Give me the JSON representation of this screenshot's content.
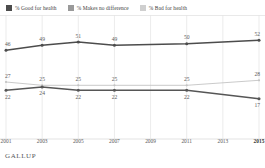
{
  "legend": {
    "items": [
      {
        "label": "% Good for health",
        "color": "#4c4c4c"
      },
      {
        "label": "% Makes no difference",
        "color": "#9a9a9a"
      },
      {
        "label": "% Bad for health",
        "color": "#cfcfcf"
      }
    ]
  },
  "footer": {
    "brand": "GALLUP"
  },
  "chart_data": {
    "type": "line",
    "title": "",
    "xlabel": "",
    "ylabel": "",
    "grid": true,
    "legend_position": "top",
    "categories": [
      "2001",
      "2003",
      "2005",
      "2007",
      "2009",
      "2011",
      "2013",
      "2015"
    ],
    "xticks": [
      "2001",
      "2003",
      "2005",
      "2007",
      "2009",
      "2011",
      "2013",
      "2015"
    ],
    "xtick_emphasis": "2015",
    "ylim": [
      0,
      60
    ],
    "series": [
      {
        "name": "% Good for health",
        "color": "#4c4c4c",
        "x": [
          "2001",
          "2003",
          "2005",
          "2007",
          "2011",
          "2015"
        ],
        "values": [
          46,
          49,
          51,
          49,
          50,
          52
        ],
        "labels": [
          "46",
          "49",
          "51",
          "49",
          "50",
          "52"
        ],
        "label_position": "above"
      },
      {
        "name": "% Makes no difference",
        "color": "#c4c4c4",
        "x": [
          "2001",
          "2003",
          "2005",
          "2007",
          "2011",
          "2015"
        ],
        "values": [
          27,
          25,
          25,
          25,
          25,
          28
        ],
        "labels": [
          "27",
          "25",
          "25",
          "25",
          "25",
          "28"
        ],
        "label_position": "above"
      },
      {
        "name": "% Bad for health",
        "color": "#565656",
        "x": [
          "2001",
          "2003",
          "2005",
          "2007",
          "2011",
          "2015"
        ],
        "values": [
          22,
          24,
          22,
          22,
          22,
          17
        ],
        "labels": [
          "22",
          "24",
          "22",
          "22",
          "22",
          "17"
        ],
        "label_position": "below"
      }
    ]
  }
}
